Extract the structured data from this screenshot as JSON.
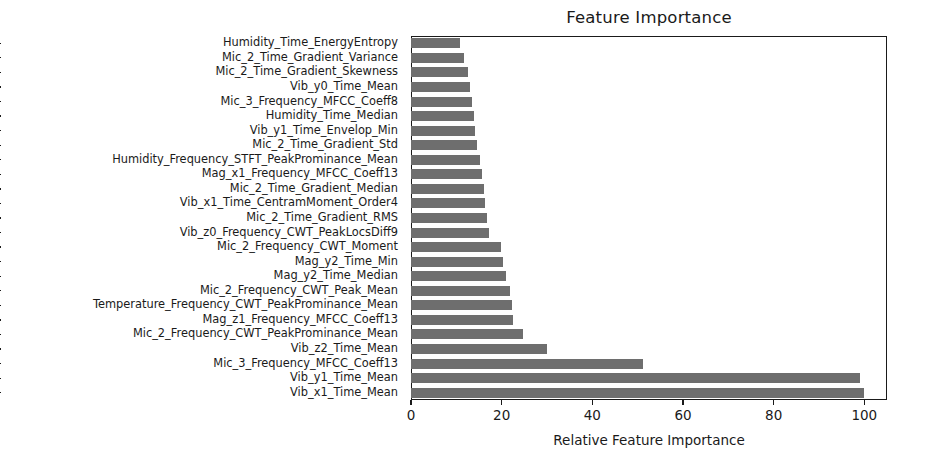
{
  "chart_data": {
    "type": "bar",
    "orientation": "horizontal",
    "title": "Feature Importance",
    "xlabel": "Relative Feature Importance",
    "ylabel": "",
    "xlim": [
      0,
      105
    ],
    "xticks": [
      0,
      20,
      40,
      60,
      80,
      100
    ],
    "xtick_labels": [
      "0",
      "20",
      "40",
      "60",
      "80",
      "100"
    ],
    "grid": false,
    "legend": null,
    "bar_color": "#6e6e6e",
    "categories": [
      "Humidity_Time_EnergyEntropy",
      "Mic_2_Time_Gradient_Variance",
      "Mic_2_Time_Gradient_Skewness",
      "Vib_y0_Time_Mean",
      "Mic_3_Frequency_MFCC_Coeff8",
      "Humidity_Time_Median",
      "Vib_y1_Time_Envelop_Min",
      "Mic_2_Time_Gradient_Std",
      "Humidity_Frequency_STFT_PeakProminance_Mean",
      "Mag_x1_Frequency_MFCC_Coeff13",
      "Mic_2_Time_Gradient_Median",
      "Vib_x1_Time_CentramMoment_Order4",
      "Mic_2_Time_Gradient_RMS",
      "Vib_z0_Frequency_CWT_PeakLocsDiff9",
      "Mic_2_Frequency_CWT_Moment",
      "Mag_y2_Time_Min",
      "Mag_y2_Time_Median",
      "Mic_2_Frequency_CWT_Peak_Mean",
      "Temperature_Frequency_CWT_PeakProminance_Mean",
      "Mag_z1_Frequency_MFCC_Coeff13",
      "Mic_2_Frequency_CWT_PeakProminance_Mean",
      "Vib_z2_Time_Mean",
      "Mic_3_Frequency_MFCC_Coeff13",
      "Vib_y1_Time_Mean",
      "Vib_x1_Time_Mean"
    ],
    "values": [
      10.7,
      11.8,
      12.6,
      13.0,
      13.4,
      13.8,
      14.2,
      14.6,
      15.2,
      15.6,
      16.0,
      16.4,
      16.8,
      17.2,
      19.8,
      20.4,
      21.0,
      21.8,
      22.2,
      22.6,
      24.6,
      30.0,
      51.2,
      99.0,
      100.0
    ]
  }
}
